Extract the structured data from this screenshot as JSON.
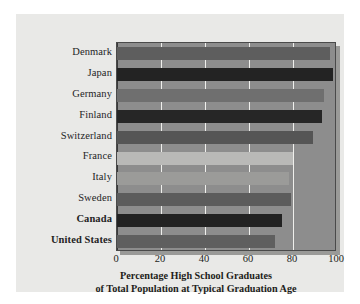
{
  "figure": {
    "background_color": "#ffffff",
    "panel_color": "#e9e9e7",
    "plot_background_color": "#8d8d8d",
    "gridline_color": "#efefec",
    "axis_color": "#3a3a3a"
  },
  "axis_title": {
    "line1": "Percentage High School Graduates",
    "line2": "of Total Population at Typical Graduation Age"
  },
  "chart_data": {
    "type": "bar",
    "orientation": "horizontal",
    "title": "Percentage High School Graduates of Total Population at Typical Graduation Age",
    "xlabel": "Percentage High School Graduates of Total Population at Typical Graduation Age",
    "ylabel": "",
    "xlim": [
      0,
      100
    ],
    "ylim": [
      0,
      10
    ],
    "grid": true,
    "gridlines_axis": "x",
    "legend": false,
    "categories": [
      "Denmark",
      "Japan",
      "Germany",
      "Finland",
      "Switzerland",
      "France",
      "Italy",
      "Sweden",
      "Canada",
      "United States"
    ],
    "values": [
      97,
      98,
      94,
      93,
      89,
      80,
      78,
      79,
      75,
      72
    ],
    "xticks": [
      0,
      20,
      40,
      60,
      80,
      100
    ],
    "xtick_labels": [
      "0",
      "20",
      "40",
      "60",
      "80",
      "100"
    ],
    "bar_colors": [
      "#5e5e5e",
      "#232323",
      "#6f6f6f",
      "#262626",
      "#555555",
      "#b9b9b7",
      "#9b9b99",
      "#5c5c5c",
      "#222222",
      "#5f5f5f"
    ],
    "highlighted_categories": [
      "Canada",
      "United States"
    ],
    "bars": [
      {
        "label": "Denmark",
        "value": 97,
        "color": "#5e5e5e",
        "bold": false
      },
      {
        "label": "Japan",
        "value": 98,
        "color": "#232323",
        "bold": false
      },
      {
        "label": "Germany",
        "value": 94,
        "color": "#6f6f6f",
        "bold": false
      },
      {
        "label": "Finland",
        "value": 93,
        "color": "#262626",
        "bold": false
      },
      {
        "label": "Switzerland",
        "value": 89,
        "color": "#555555",
        "bold": false
      },
      {
        "label": "France",
        "value": 80,
        "color": "#b9b9b7",
        "bold": false
      },
      {
        "label": "Italy",
        "value": 78,
        "color": "#9b9b99",
        "bold": false
      },
      {
        "label": "Sweden",
        "value": 79,
        "color": "#5c5c5c",
        "bold": false
      },
      {
        "label": "Canada",
        "value": 75,
        "color": "#222222",
        "bold": true
      },
      {
        "label": "United States",
        "value": 72,
        "color": "#5f5f5f",
        "bold": true
      }
    ]
  }
}
